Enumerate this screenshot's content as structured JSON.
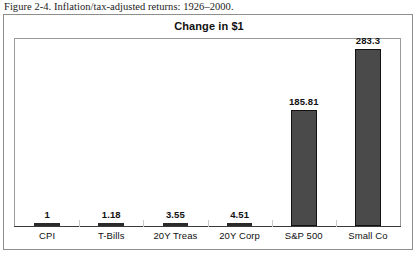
{
  "caption": "Figure 2-4. Inflation/tax-adjusted returns: 1926–2000.",
  "chart": {
    "title": "Change in $1"
  },
  "colors": {
    "bar_fill": "#4a4a4a",
    "bar_outline": "#111111",
    "frame": "#9a9a9a",
    "figure_border": "#8e8e8e",
    "text": "#111111"
  },
  "chart_data": {
    "type": "bar",
    "title": "Change in $1",
    "xlabel": "",
    "ylabel": "",
    "ylim": [
      0,
      300
    ],
    "grid": false,
    "legend": "none",
    "categories": [
      "CPI",
      "T-Bills",
      "20Y Treas",
      "20Y Corp",
      "S&P 500",
      "Small Co"
    ],
    "values": [
      1,
      1.18,
      3.55,
      4.51,
      185.81,
      283.3
    ],
    "value_labels": [
      "1",
      "1.18",
      "3.55",
      "4.51",
      "185.81",
      "283.3"
    ]
  }
}
